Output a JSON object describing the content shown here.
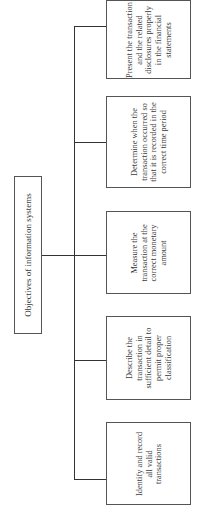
{
  "diagram": {
    "root": {
      "label": "Objectives of information systems"
    },
    "children": [
      {
        "label": "Present the transaction and the related disclosures properly in the financial statements"
      },
      {
        "label": "Determine when the transaction occurred so that it is recorded in the correct time period"
      },
      {
        "label": "Measure the transaction at the correct monetary amount"
      },
      {
        "label": "Describe the transaction in sufficient detail to permit proper classification"
      },
      {
        "label": "Identify and record all valid transactions"
      }
    ],
    "orientation": "rotated-90-ccw",
    "line_color": "#333333"
  }
}
